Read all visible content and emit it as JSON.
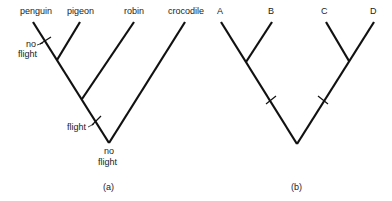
{
  "diagrams": [
    {
      "id": "a",
      "caption": "(a)",
      "taxa": [
        "penguin",
        "pigeon",
        "robin",
        "crocodile"
      ],
      "annotations": {
        "penguin_branch": [
          "no",
          "flight"
        ],
        "bird_stem": "flight",
        "root": [
          "no",
          "flight"
        ]
      }
    },
    {
      "id": "b",
      "caption": "(b)",
      "taxa": [
        "A",
        "B",
        "C",
        "D"
      ]
    }
  ]
}
